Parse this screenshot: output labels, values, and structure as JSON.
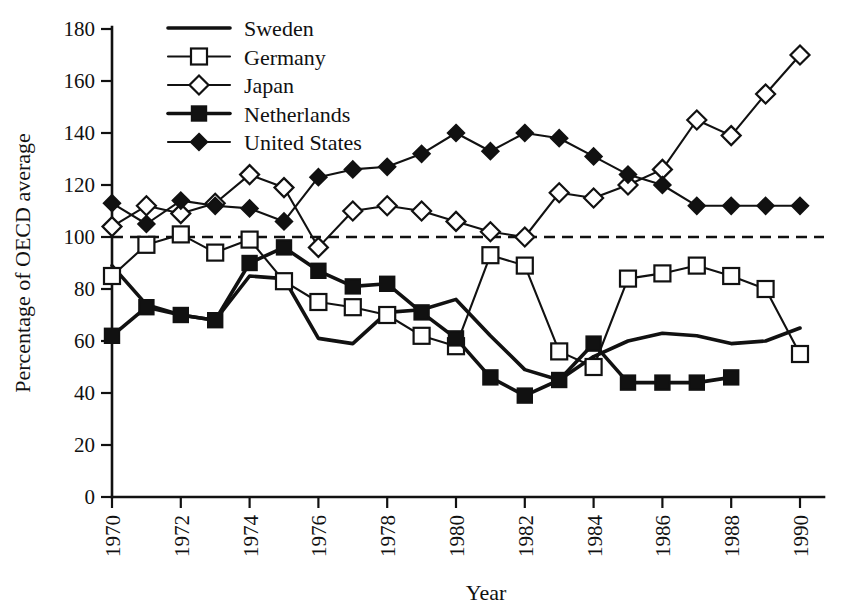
{
  "chart_data": {
    "type": "line",
    "title": "",
    "subtitle": "",
    "xlabel": "Year",
    "ylabel": "Percentage of OECD average",
    "xlim": [
      1970,
      1990
    ],
    "ylim": [
      0,
      180
    ],
    "xticks": [
      1970,
      1972,
      1974,
      1976,
      1978,
      1980,
      1982,
      1984,
      1986,
      1988,
      1990
    ],
    "xtick_labels": [
      "1970",
      "1972",
      "1974",
      "1976",
      "1978",
      "1980",
      "1982",
      "1984",
      "1986",
      "1988",
      "1990"
    ],
    "yticks": [
      0,
      20,
      40,
      60,
      80,
      100,
      120,
      140,
      160,
      180
    ],
    "ytick_labels": [
      "0",
      "20",
      "40",
      "60",
      "80",
      "100",
      "120",
      "140",
      "160",
      "180"
    ],
    "grid": false,
    "legend_position": "top-left",
    "reference_lines": [
      {
        "name": "oecd-average",
        "orientation": "horizontal",
        "value": 100,
        "style": "dashed"
      }
    ],
    "x": [
      1970,
      1971,
      1972,
      1973,
      1974,
      1975,
      1976,
      1977,
      1978,
      1979,
      1980,
      1981,
      1982,
      1983,
      1984,
      1985,
      1986,
      1987,
      1988,
      1989,
      1990
    ],
    "series": [
      {
        "name": "Sweden",
        "marker": "none",
        "line": "solid-thick",
        "x": [
          1970,
          1971,
          1972,
          1973,
          1974,
          1975,
          1976,
          1977,
          1978,
          1979,
          1980,
          1981,
          1982,
          1983,
          1984,
          1985,
          1986,
          1987,
          1988,
          1989,
          1990
        ],
        "values": [
          89,
          74,
          70,
          68,
          85,
          84,
          61,
          59,
          71,
          72,
          76,
          62,
          49,
          45,
          54,
          60,
          63,
          62,
          59,
          60,
          65
        ]
      },
      {
        "name": "Germany",
        "marker": "open-square",
        "line": "solid",
        "x": [
          1970,
          1971,
          1972,
          1973,
          1974,
          1975,
          1976,
          1977,
          1978,
          1979,
          1980,
          1981,
          1982,
          1983,
          1984,
          1985,
          1986,
          1987,
          1988,
          1989,
          1990
        ],
        "values": [
          85,
          97,
          101,
          94,
          99,
          83,
          75,
          73,
          70,
          62,
          58,
          93,
          89,
          56,
          50,
          84,
          86,
          89,
          85,
          80,
          55
        ]
      },
      {
        "name": "Japan",
        "marker": "open-diamond",
        "line": "solid",
        "x": [
          1970,
          1971,
          1972,
          1973,
          1974,
          1975,
          1976,
          1977,
          1978,
          1979,
          1980,
          1981,
          1982,
          1983,
          1984,
          1985,
          1986,
          1987,
          1988,
          1989,
          1990
        ],
        "values": [
          104,
          112,
          109,
          113,
          124,
          119,
          96,
          110,
          112,
          110,
          106,
          102,
          100,
          117,
          115,
          120,
          126,
          145,
          139,
          155,
          170
        ]
      },
      {
        "name": "Netherlands",
        "marker": "filled-square",
        "line": "solid-thick",
        "x": [
          1970,
          1971,
          1972,
          1973,
          1974,
          1975,
          1976,
          1977,
          1978,
          1979,
          1980,
          1981,
          1982,
          1983,
          1984,
          1985,
          1986,
          1987,
          1988
        ],
        "values": [
          62,
          73,
          70,
          68,
          90,
          96,
          87,
          81,
          82,
          71,
          61,
          46,
          39,
          45,
          59,
          44,
          44,
          44,
          46
        ]
      },
      {
        "name": "United States",
        "marker": "filled-diamond",
        "line": "solid",
        "x": [
          1970,
          1971,
          1972,
          1973,
          1974,
          1975,
          1976,
          1977,
          1978,
          1979,
          1980,
          1981,
          1982,
          1983,
          1984,
          1985,
          1986,
          1987,
          1988,
          1989,
          1990
        ],
        "values": [
          113,
          105,
          114,
          112,
          111,
          106,
          123,
          126,
          127,
          132,
          140,
          133,
          140,
          138,
          131,
          124,
          120,
          112,
          112,
          112,
          112
        ]
      }
    ]
  },
  "legend": {
    "items": [
      {
        "label": "Sweden",
        "marker": "none"
      },
      {
        "label": "Germany",
        "marker": "open-square"
      },
      {
        "label": "Japan",
        "marker": "open-diamond"
      },
      {
        "label": "Netherlands",
        "marker": "filled-square"
      },
      {
        "label": "United States",
        "marker": "filled-diamond"
      }
    ]
  },
  "colors": {
    "ink": "#111111",
    "background": "#ffffff",
    "marker_fill_open": "#ffffff"
  }
}
